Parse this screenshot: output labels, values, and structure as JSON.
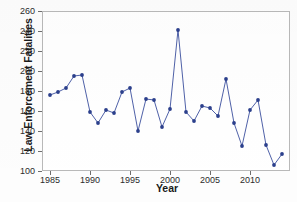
{
  "chart_data": {
    "type": "line",
    "title": "",
    "xlabel": "Year",
    "ylabel": "Law Enforcement Fatalities",
    "xlim": [
      1984,
      2015
    ],
    "ylim": [
      100,
      260
    ],
    "ytick_step": 20,
    "yticks": [
      100,
      120,
      140,
      160,
      180,
      200,
      220,
      240,
      260
    ],
    "xticks": [
      1985,
      1990,
      1995,
      2000,
      2005,
      2010
    ],
    "xtick_labels": [
      "1985",
      "1990",
      "1995",
      "2000",
      "2005",
      "2010"
    ],
    "grid": false,
    "legend": "none",
    "marker": "circle",
    "marker_color": "#2b3f8c",
    "line_color": "#3b4f9e",
    "x": [
      1985,
      1986,
      1987,
      1988,
      1989,
      1990,
      1991,
      1992,
      1993,
      1994,
      1995,
      1996,
      1997,
      1998,
      1999,
      2000,
      2001,
      2002,
      2003,
      2004,
      2005,
      2006,
      2007,
      2008,
      2009,
      2010,
      2011,
      2012,
      2013,
      2014
    ],
    "values": [
      176,
      179,
      183,
      195,
      196,
      159,
      148,
      161,
      158,
      179,
      183,
      140,
      172,
      171,
      144,
      162,
      241,
      159,
      150,
      165,
      163,
      155,
      192,
      148,
      125,
      161,
      171,
      126,
      106,
      117
    ],
    "series": [
      {
        "name": "Law Enforcement Fatalities",
        "values": [
          176,
          179,
          183,
          195,
          196,
          159,
          148,
          161,
          158,
          179,
          183,
          140,
          172,
          171,
          144,
          162,
          241,
          159,
          150,
          165,
          163,
          155,
          192,
          148,
          125,
          161,
          171,
          126,
          106,
          117
        ]
      }
    ],
    "annotations": []
  },
  "axes": {
    "frame_color": "#b9b9b9",
    "tick_color": "#6e6e6e",
    "text_color": "#2b2b2b"
  }
}
